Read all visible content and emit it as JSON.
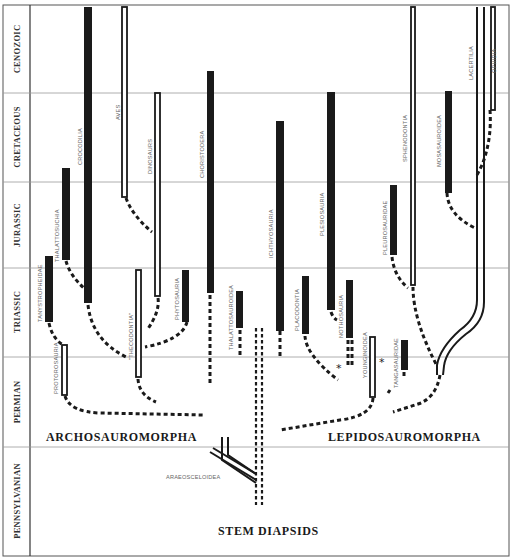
{
  "figure": {
    "periods": [
      {
        "name": "CENOZOIC",
        "y_top": 5,
        "y_bottom": 93
      },
      {
        "name": "CRETACEOUS",
        "y_top": 93,
        "y_bottom": 182
      },
      {
        "name": "JURASSIC",
        "y_top": 182,
        "y_bottom": 268
      },
      {
        "name": "TRIASSIC",
        "y_top": 268,
        "y_bottom": 357
      },
      {
        "name": "PERMIAN",
        "y_top": 357,
        "y_bottom": 447
      },
      {
        "name": "PENNSYLVANIAN",
        "y_top": 447,
        "y_bottom": 555
      }
    ],
    "groups": {
      "archosauromorpha": "ARCHOSAUROMORPHA",
      "lepidosauromorpha": "LEPIDOSAUROMORPHA",
      "stem_diapsids": "STEM DIAPSIDS"
    },
    "taxa": {
      "protorosauria": "PROTOROSAURIA",
      "tanystropheidae": "TANYSTROPHEIDAE",
      "thalattosuchia": "THALATTOSUCHIA",
      "crocodilia": "CROCODILIA",
      "thecodontia": "\"THECODONTIA\"",
      "aves": "AVES",
      "dinosaurs": "DINOSAURS",
      "phytosauria": "PHYTOSAURIA",
      "choristodera": "CHORISTODERA",
      "thalattosauroidea": "THALATTOSAUROIDEA",
      "araeosceloidea": "ARAEOSCELOIDEA",
      "ichthyosauria": "ICHTHYOSAURIA",
      "placodontia": "PLACODONTIA",
      "plesiosauria": "PLESIOSAURIA",
      "nothosauria": "NOTHOSAURIA",
      "younginoidea": "YOUNGINOIDEA",
      "tangasauridae": "TANGASAURIDAE",
      "pleurosauridae": "PLEUROSAURIDAE",
      "sphenodontia": "SPHENODONTIA",
      "mosasauroidea": "MOSASAUROIDEA",
      "lacertilia": "LACERTILIA",
      "ophidia": "OPHIDIA"
    },
    "markers": {
      "asterisk": "*"
    },
    "colors": {
      "ink": "#1a1a1a",
      "grid": "#9a9a9a",
      "label": "#666666"
    }
  }
}
